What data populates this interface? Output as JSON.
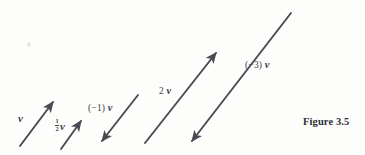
{
  "figure": {
    "caption": "Figure 3.5",
    "background_color": "#fdfdfc",
    "ink_color": "#4a4a52"
  },
  "labels": {
    "v": "v",
    "half_v_numerator": "1",
    "half_v_denominator": "2",
    "half_v_vector": "v",
    "neg1_v_scalar": "(−1)",
    "neg1_v_vector": "v",
    "two_v_scalar": "2",
    "two_v_vector": "v",
    "neg3_v_scalar": "(−3)",
    "neg3_v_vector": "v"
  },
  "vectors": [
    {
      "name": "v",
      "scalar": 1,
      "label": "v",
      "x1": 20,
      "y1": 146,
      "x2": 53,
      "y2": 102,
      "direction": "up-right"
    },
    {
      "name": "half-v",
      "scalar": 0.5,
      "label": "½ v",
      "x1": 61,
      "y1": 149,
      "x2": 81,
      "y2": 121,
      "direction": "up-right"
    },
    {
      "name": "negative-1-v",
      "scalar": -1,
      "label": "(−1) v",
      "x1": 138,
      "y1": 95,
      "x2": 102,
      "y2": 141,
      "direction": "down-left"
    },
    {
      "name": "2-v",
      "scalar": 2,
      "label": "2 v",
      "x1": 145,
      "y1": 143,
      "x2": 216,
      "y2": 53,
      "direction": "up-right"
    },
    {
      "name": "negative-3-v",
      "scalar": -3,
      "label": "(−3) v",
      "x1": 291,
      "y1": 13,
      "x2": 192,
      "y2": 141,
      "direction": "down-left"
    }
  ]
}
